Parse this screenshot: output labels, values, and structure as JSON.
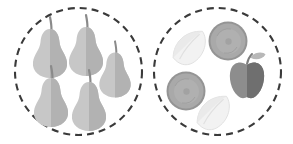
{
  "canvas": {
    "width": 293,
    "height": 144,
    "background": "#ffffff",
    "title": "two-dashed-sets-of-grayscale-fruit"
  },
  "style": {
    "dash_stroke": "#3a3a3a",
    "dash_width": 2.1,
    "dash_pattern": "7 5",
    "pear_light": "#c7c7c7",
    "pear_dark": "#b0b0b0",
    "pear_stem": "#8a8a8a",
    "slice_fill": "#a9a9a9",
    "slice_rim": "#949494",
    "slice_inner": "#b3b3b3",
    "leaf_fill": "#f2f2f2",
    "leaf_shade": "#e4e4e4",
    "leaf_outline": "#dcdcdc",
    "apple_light": "#8d8d8d",
    "apple_dark": "#6f6f6f",
    "apple_leaf": "#b8b8b8",
    "apple_stem": "#7d7d7d"
  },
  "sets": [
    {
      "name": "left-set",
      "cx": 78.5,
      "cy": 71.5,
      "r": 63.5,
      "item_count": 5,
      "items": [
        {
          "name": "pear",
          "cx": 50,
          "cy": 47,
          "scale": 1.0,
          "flip": false
        },
        {
          "name": "pear",
          "cx": 86,
          "cy": 45,
          "scale": 1.0,
          "flip": false
        },
        {
          "name": "pear",
          "cx": 115,
          "cy": 69,
          "scale": 0.92,
          "flip": false
        },
        {
          "name": "pear",
          "cx": 51,
          "cy": 96,
          "scale": 1.0,
          "flip": false
        },
        {
          "name": "pear",
          "cx": 89,
          "cy": 100,
          "scale": 1.0,
          "flip": false
        }
      ]
    },
    {
      "name": "right-set",
      "cx": 217.5,
      "cy": 71.5,
      "r": 63.5,
      "item_count": 5,
      "items": [
        {
          "name": "lemon-leaf",
          "cx": 190,
          "cy": 48,
          "scale": 1.0,
          "rotate": -18
        },
        {
          "name": "fruit-slice",
          "cx": 228,
          "cy": 41,
          "scale": 1.0
        },
        {
          "name": "fruit-slice",
          "cx": 186,
          "cy": 91,
          "scale": 1.0
        },
        {
          "name": "apple",
          "cx": 247,
          "cy": 80,
          "scale": 1.0
        },
        {
          "name": "lemon-leaf",
          "cx": 214,
          "cy": 113,
          "scale": 1.0,
          "rotate": -18
        }
      ]
    }
  ]
}
